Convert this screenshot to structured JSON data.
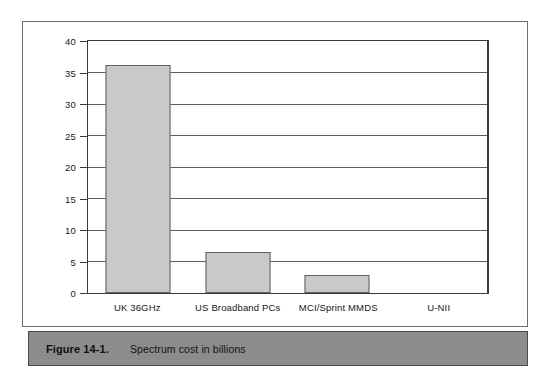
{
  "figure": {
    "caption_number": "Figure 14-1.",
    "caption_text": "Spectrum cost in billions"
  },
  "chart_data": {
    "type": "bar",
    "title": "Spectrum cost in billions",
    "xlabel": "",
    "ylabel": "",
    "categories": [
      "UK 36GHz",
      "US Broadband PCs",
      "MCI/Sprint MMDS",
      "U-NII"
    ],
    "values": [
      36.2,
      6.5,
      2.9,
      0
    ],
    "ylim": [
      0,
      40
    ],
    "yticks": [
      0,
      5,
      10,
      15,
      20,
      25,
      30,
      35,
      40
    ],
    "ytick_labels": [
      "0",
      "5",
      "10",
      "15",
      "20",
      "25",
      "30",
      "35",
      "40"
    ],
    "grid": true,
    "legend": false,
    "bar_color": "#c9c9c9",
    "bar_border_color": "#5e5e5e",
    "axis_color": "#3a3a3a",
    "gridline_color": "#5a5a5a"
  }
}
